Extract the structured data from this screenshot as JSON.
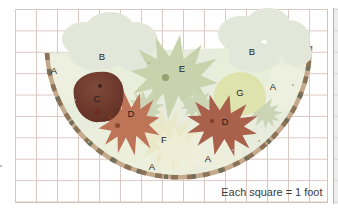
{
  "diagram": {
    "legend": "Each square = 1 foot",
    "labels": [
      {
        "id": "A1",
        "text": "A"
      },
      {
        "id": "B1",
        "text": "B"
      },
      {
        "id": "E",
        "text": "E"
      },
      {
        "id": "B2",
        "text": "B"
      },
      {
        "id": "A2",
        "text": "A"
      },
      {
        "id": "G",
        "text": "G"
      },
      {
        "id": "C",
        "text": "C"
      },
      {
        "id": "D1",
        "text": "D"
      },
      {
        "id": "D2",
        "text": "D"
      },
      {
        "id": "F",
        "text": "F"
      },
      {
        "id": "A3",
        "text": "A"
      },
      {
        "id": "A4",
        "text": "A"
      }
    ],
    "colors": {
      "grid_line": "#dbc8c2",
      "bed_fill": "#e8ecdc",
      "edging_tan": "#c4a98c",
      "edging_brown": "#8c7357",
      "plant_b_foliage": "#e3e7d9",
      "plant_e": "#c8d2ac",
      "plant_c": "#6e3a2d",
      "plant_d_left": "#bd7457",
      "plant_d_right": "#aa614b",
      "plant_f": "#ebe8c9",
      "plant_g": "#dee3ae"
    }
  }
}
